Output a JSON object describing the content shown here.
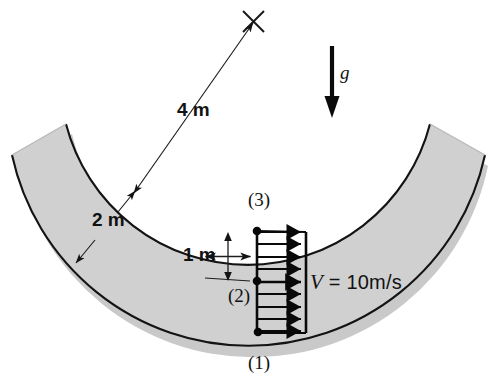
{
  "figure": {
    "type": "engineering-diagram",
    "background_color": "#ffffff",
    "channel": {
      "fill_color": "#cccccc",
      "edge_color": "#1a1a1a",
      "center_of_curvature_marker": "x-cross-icon",
      "center_x": 253,
      "center_y": 21
    },
    "labels": {
      "outer_radius": "4 m",
      "channel_width": "2 m",
      "station_height": "1 m",
      "station_top": "(3)",
      "station_mid": "(2)",
      "station_bottom": "(1)",
      "gravity": "g",
      "velocity_symbol": "V",
      "velocity_equals": "=",
      "velocity_value": "10m/s",
      "velocity_full": "V = 10m/s"
    },
    "velocity_profile": {
      "shape": "uniform-rectangular",
      "arrow_count": 9,
      "magnitude": 10,
      "units": "m/s",
      "direction": "horizontal-right"
    },
    "gravity_arrow": {
      "direction": "down",
      "symbol": "g"
    }
  }
}
